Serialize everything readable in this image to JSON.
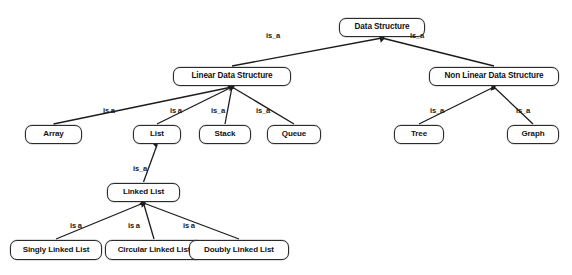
{
  "diagram": {
    "type": "hierarchy-tree",
    "colors": {
      "background": "#ffffff",
      "node_fill": "#ffffff",
      "node_border": "#2b2b2b",
      "edge": "#1c1c1c",
      "text": "#111111"
    },
    "nodes": [
      {
        "id": "data-structure",
        "label": "Data Structure",
        "x": 339,
        "y": 18,
        "w": 86,
        "h": 19,
        "font": 8.2
      },
      {
        "id": "linear-data-structure",
        "label": "Linear Data Structure",
        "x": 173,
        "y": 67,
        "w": 118,
        "h": 19,
        "font": 8.2
      },
      {
        "id": "non-linear-data-structure",
        "label": "Non Linear Data Structure",
        "x": 429,
        "y": 67,
        "w": 130,
        "h": 19,
        "font": 8.2
      },
      {
        "id": "array",
        "label": "Array",
        "x": 25,
        "y": 125,
        "w": 57,
        "h": 19,
        "font": 8.0
      },
      {
        "id": "list",
        "label": "List",
        "x": 133,
        "y": 125,
        "w": 48,
        "h": 19,
        "font": 8.0
      },
      {
        "id": "stack",
        "label": "Stack",
        "x": 199,
        "y": 125,
        "w": 52,
        "h": 19,
        "font": 8.0
      },
      {
        "id": "queue",
        "label": "Queue",
        "x": 267,
        "y": 125,
        "w": 54,
        "h": 19,
        "font": 8.0
      },
      {
        "id": "tree",
        "label": "Tree",
        "x": 394,
        "y": 125,
        "w": 50,
        "h": 19,
        "font": 8.0
      },
      {
        "id": "graph",
        "label": "Graph",
        "x": 507,
        "y": 125,
        "w": 52,
        "h": 19,
        "font": 8.0
      },
      {
        "id": "linked-list",
        "label": "Linked List",
        "x": 107,
        "y": 183,
        "w": 73,
        "h": 19,
        "font": 8.0
      },
      {
        "id": "singly-linked-list",
        "label": "Singly Linked List",
        "x": 10,
        "y": 240,
        "w": 92,
        "h": 20,
        "font": 8.0
      },
      {
        "id": "circular-linked-list",
        "label": "Circular Linked List",
        "x": 105,
        "y": 240,
        "w": 98,
        "h": 20,
        "font": 8.0
      },
      {
        "id": "doubly-linked-list",
        "label": "Doubly Linked List",
        "x": 189,
        "y": 240,
        "w": 100,
        "h": 20,
        "font": 8.0
      }
    ],
    "edges": [
      {
        "from": "data-structure",
        "to": "linear-data-structure",
        "label": "is_a",
        "label_x": 266,
        "label_y": 31
      },
      {
        "from": "data-structure",
        "to": "non-linear-data-structure",
        "label": "is_a",
        "label_x": 410,
        "label_y": 31
      },
      {
        "from": "linear-data-structure",
        "to": "array",
        "label": "is  a",
        "label_x": 103,
        "label_y": 106
      },
      {
        "from": "linear-data-structure",
        "to": "list",
        "label": "is  a",
        "label_x": 170,
        "label_y": 106
      },
      {
        "from": "linear-data-structure",
        "to": "stack",
        "label": "is_a",
        "label_x": 211,
        "label_y": 106
      },
      {
        "from": "linear-data-structure",
        "to": "queue",
        "label": "is_a",
        "label_x": 256,
        "label_y": 106
      },
      {
        "from": "non-linear-data-structure",
        "to": "tree",
        "label": "is_a",
        "label_x": 430,
        "label_y": 106
      },
      {
        "from": "non-linear-data-structure",
        "to": "graph",
        "label": "is_a",
        "label_x": 516,
        "label_y": 106
      },
      {
        "from": "list",
        "to": "linked-list",
        "label": "is_a",
        "label_x": 133,
        "label_y": 164
      },
      {
        "from": "linked-list",
        "to": "singly-linked-list",
        "label": "is  a",
        "label_x": 70,
        "label_y": 221
      },
      {
        "from": "linked-list",
        "to": "circular-linked-list",
        "label": "is  a",
        "label_x": 128,
        "label_y": 221
      },
      {
        "from": "linked-list",
        "to": "doubly-linked-list",
        "label": "is  a",
        "label_x": 183,
        "label_y": 221
      }
    ]
  }
}
